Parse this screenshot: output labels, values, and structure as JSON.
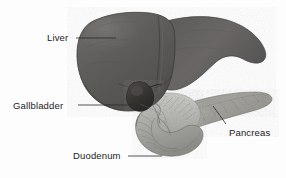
{
  "figure": {
    "type": "anatomical-illustration",
    "width": 286,
    "height": 178,
    "background_color": "#fdfdfd",
    "rendering": "grayscale halftone engraving"
  },
  "labels": [
    {
      "id": "liver",
      "text": "Liver",
      "leader": "horizontal-line-right",
      "color": "#1c1c1c"
    },
    {
      "id": "gallbladder",
      "text": "Gallbladder",
      "leader": "horizontal-line-right",
      "color": "#1c1c1c"
    },
    {
      "id": "duodenum",
      "text": "Duodenum",
      "leader": "horizontal-line-right",
      "color": "#1c1c1c"
    },
    {
      "id": "pancreas",
      "text": "Pancreas",
      "leader": "diagonal-line-up-left",
      "color": "#1c1c1c"
    }
  ],
  "structures": [
    {
      "id": "liver",
      "name": "Liver",
      "fill_color": "#62605e",
      "description": "Large dark organ occupying upper portion, rounded left lobe with tapering right lobe"
    },
    {
      "id": "gallbladder",
      "name": "Gallbladder",
      "fill_color": "#3a3836",
      "description": "Dark pear-shaped sac beneath the liver"
    },
    {
      "id": "duodenum",
      "name": "Duodenum",
      "fill_color": "#a8a8a5",
      "description": "Light grey C-shaped loop of intestine below and right of the liver"
    },
    {
      "id": "pancreas",
      "name": "Pancreas",
      "fill_color": "#989691",
      "description": "Elongated tapering gland extending to the upper right"
    }
  ],
  "leader_line_color": "#2a2a2a"
}
